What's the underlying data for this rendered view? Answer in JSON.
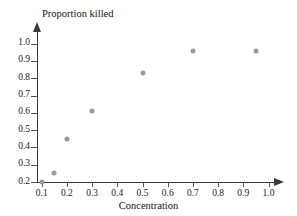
{
  "chart_data": {
    "type": "scatter",
    "title": "",
    "xlabel": "Concentration",
    "ylabel": "Proportion killed",
    "xlim": [
      0.05,
      1.05
    ],
    "ylim": [
      0.2,
      1.05
    ],
    "grid": false,
    "legend": null,
    "xticks": [
      "0.1",
      "0.2",
      "0.3",
      "0.4",
      "0.5",
      "0.6",
      "0.7",
      "0.8",
      "0.9",
      "1.0"
    ],
    "xtick_values": [
      0.1,
      0.2,
      0.3,
      0.4,
      0.5,
      0.6,
      0.7,
      0.8,
      0.9,
      1.0
    ],
    "yticks": [
      "1.0",
      "0.9",
      "0.8",
      "0.7",
      "0.6",
      "0.5",
      "0.4",
      "0.3",
      "0.2"
    ],
    "ytick_values": [
      1.0,
      0.9,
      0.8,
      0.7,
      0.6,
      0.5,
      0.4,
      0.3,
      0.2
    ],
    "marker_color": "#9b9b9b",
    "axis_color": "#3a3a3a",
    "points": [
      {
        "x": 0.1,
        "y": 0.2
      },
      {
        "x": 0.15,
        "y": 0.25
      },
      {
        "x": 0.2,
        "y": 0.45
      },
      {
        "x": 0.3,
        "y": 0.61
      },
      {
        "x": 0.5,
        "y": 0.83
      },
      {
        "x": 0.7,
        "y": 0.96
      },
      {
        "x": 0.95,
        "y": 0.96
      }
    ]
  }
}
